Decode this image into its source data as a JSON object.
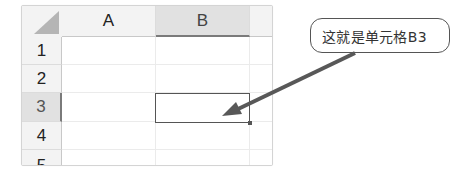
{
  "spreadsheet": {
    "columns": [
      {
        "label": "A",
        "selected": false
      },
      {
        "label": "B",
        "selected": true
      },
      {
        "label": "",
        "selected": false
      }
    ],
    "rows": [
      {
        "label": "1",
        "selected": false
      },
      {
        "label": "2",
        "selected": false
      },
      {
        "label": "3",
        "selected": true
      },
      {
        "label": "4",
        "selected": false
      },
      {
        "label": "5",
        "selected": false
      }
    ],
    "active_cell": "B3"
  },
  "callout": {
    "text": "这就是单元格B3"
  },
  "colors": {
    "header_bg": "#f3f3f3",
    "header_selected_bg": "#e1e1e1",
    "arrow": "#555555",
    "active_border": "#555555"
  }
}
